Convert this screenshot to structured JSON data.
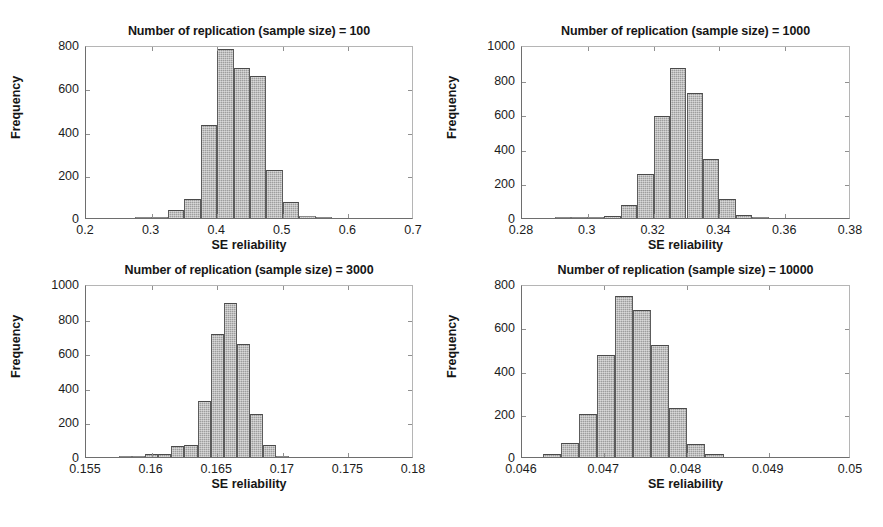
{
  "figure": {
    "background": "#ffffff",
    "bar_fill": "#9d9d9d",
    "bar_edge": "#4a4a4a",
    "axis_color": "#8e8e8e",
    "text_color": "#1a1a1a",
    "layout": "2x2 grid of histogram panels"
  },
  "chart_data": [
    {
      "type": "bar",
      "panel": 1,
      "title": "Number of replication (sample size) = 100",
      "xlabel": "SE reliability",
      "ylabel": "Frequency",
      "xlim": [
        0.2,
        0.7
      ],
      "ylim": [
        0,
        800
      ],
      "xticks": [
        0.2,
        0.3,
        0.4,
        0.5,
        0.6,
        0.7
      ],
      "xticklabels": [
        "0.2",
        "0.3",
        "0.4",
        "0.5",
        "0.6",
        "0.7"
      ],
      "yticks": [
        0,
        200,
        400,
        600,
        800
      ],
      "yticklabels": [
        "0",
        "200",
        "400",
        "600",
        "800"
      ],
      "grid": false,
      "legend": "none",
      "bin_width": 0.025,
      "bin_starts": [
        0.275,
        0.3,
        0.325,
        0.35,
        0.375,
        0.4,
        0.425,
        0.45,
        0.475,
        0.5,
        0.525,
        0.55
      ],
      "values": [
        4,
        6,
        35,
        90,
        430,
        780,
        695,
        655,
        220,
        75,
        8,
        3
      ]
    },
    {
      "type": "bar",
      "panel": 2,
      "title": "Number of replication (sample size) = 1000",
      "xlabel": "SE reliability",
      "ylabel": "Frequency",
      "xlim": [
        0.28,
        0.38
      ],
      "ylim": [
        0,
        1000
      ],
      "xticks": [
        0.28,
        0.3,
        0.32,
        0.34,
        0.36,
        0.38
      ],
      "xticklabels": [
        "0.28",
        "0.3",
        "0.32",
        "0.34",
        "0.36",
        "0.38"
      ],
      "yticks": [
        0,
        200,
        400,
        600,
        800,
        1000
      ],
      "yticklabels": [
        "0",
        "200",
        "400",
        "600",
        "800",
        "1000"
      ],
      "grid": false,
      "legend": "none",
      "bin_width": 0.005,
      "bin_starts": [
        0.29,
        0.295,
        0.3,
        0.305,
        0.31,
        0.315,
        0.32,
        0.325,
        0.33,
        0.335,
        0.34,
        0.345,
        0.35
      ],
      "values": [
        3,
        5,
        8,
        12,
        75,
        255,
        590,
        865,
        725,
        340,
        110,
        15,
        4
      ]
    },
    {
      "type": "bar",
      "panel": 3,
      "title": "Number of replication (sample size) = 3000",
      "xlabel": "SE reliability",
      "ylabel": "Frequency",
      "xlim": [
        0.155,
        0.18
      ],
      "ylim": [
        0,
        1000
      ],
      "xticks": [
        0.155,
        0.16,
        0.165,
        0.17,
        0.175,
        0.18
      ],
      "xticklabels": [
        "0.155",
        "0.16",
        "0.165",
        "0.17",
        "0.175",
        "0.18"
      ],
      "yticks": [
        0,
        200,
        400,
        600,
        800,
        1000
      ],
      "yticklabels": [
        "0",
        "200",
        "400",
        "600",
        "800",
        "1000"
      ],
      "grid": false,
      "legend": "none",
      "bin_width": 0.001,
      "bin_starts": [
        0.1575,
        0.1585,
        0.1595,
        0.1605,
        0.1615,
        0.1625,
        0.1635,
        0.1645,
        0.1655,
        0.1665,
        0.1675,
        0.1685,
        0.1695
      ],
      "values": [
        3,
        5,
        15,
        18,
        65,
        70,
        325,
        710,
        890,
        655,
        250,
        70,
        8
      ]
    },
    {
      "type": "bar",
      "panel": 4,
      "title": "Number of replication (sample size) = 10000",
      "xlabel": "SE reliability",
      "ylabel": "Frequency",
      "xlim": [
        0.046,
        0.05
      ],
      "ylim": [
        0,
        800
      ],
      "xticks": [
        0.046,
        0.047,
        0.048,
        0.049,
        0.05
      ],
      "xticklabels": [
        "0.046",
        "0.047",
        "0.048",
        "0.049",
        "0.05"
      ],
      "yticks": [
        0,
        200,
        400,
        600,
        800
      ],
      "yticklabels": [
        "0",
        "200",
        "400",
        "600",
        "800"
      ],
      "grid": false,
      "legend": "none",
      "bin_width": 0.00022,
      "bin_starts": [
        0.04625,
        0.04647,
        0.04669,
        0.04691,
        0.04713,
        0.04735,
        0.04757,
        0.04779,
        0.04801,
        0.04823
      ],
      "values": [
        12,
        65,
        200,
        470,
        745,
        680,
        520,
        225,
        60,
        12
      ]
    }
  ]
}
